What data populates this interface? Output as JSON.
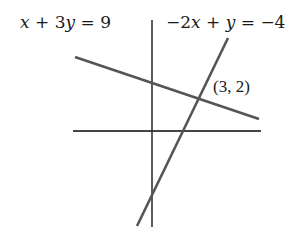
{
  "diagram": {
    "type": "system-of-linear-equations-graph",
    "line1": {
      "label": "x + 3y = 9",
      "label_parts": [
        "x",
        " + 3",
        "y",
        " = 9"
      ],
      "x1": 75,
      "y1": 57,
      "x2": 259,
      "y2": 119,
      "color": "#555555"
    },
    "line2": {
      "label": "−2x + y = −4",
      "label_parts": [
        "−2",
        "x",
        " + ",
        "y",
        " = −4"
      ],
      "x1": 228,
      "y1": 38,
      "x2": 137,
      "y2": 226,
      "color": "#555555"
    },
    "intersection": {
      "label": "(3, 2)",
      "x": 3,
      "y": 2
    },
    "axes": {
      "x_axis": {
        "x1": 73,
        "y1": 131,
        "x2": 261,
        "y2": 131,
        "color": "#444444"
      },
      "y_axis": {
        "x1": 152,
        "y1": 20,
        "x2": 152,
        "y2": 227,
        "color": "#333333"
      }
    }
  }
}
